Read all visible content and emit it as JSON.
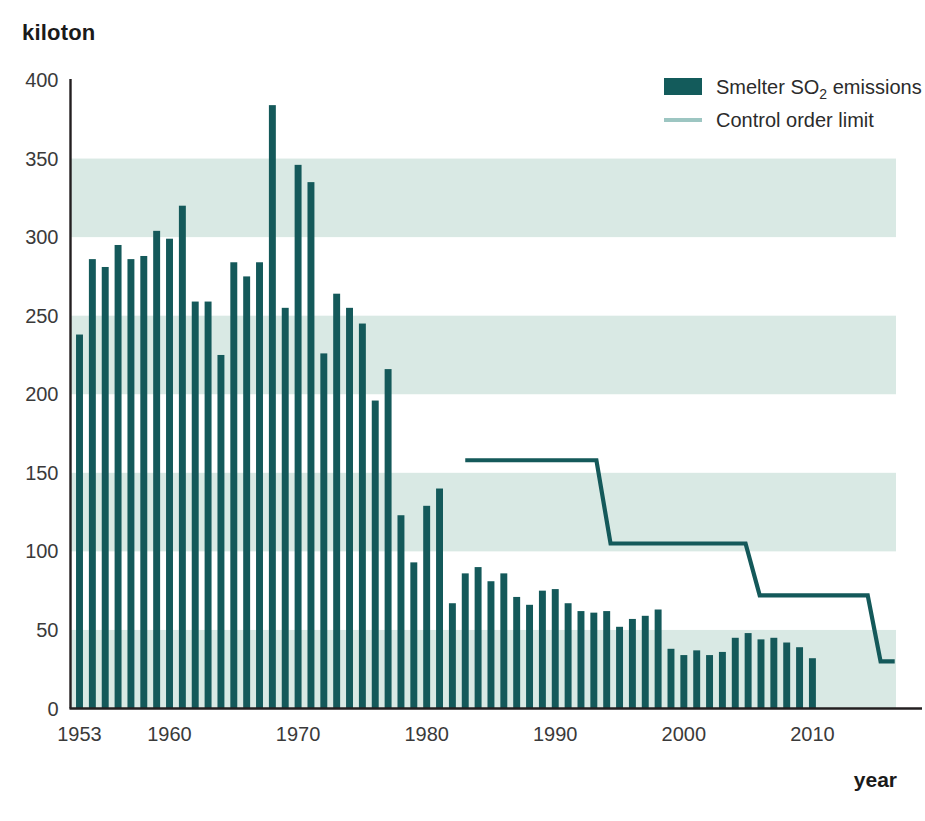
{
  "axis": {
    "unit_label": "kiloton",
    "x_axis_title": "year"
  },
  "legend": {
    "items": [
      {
        "label_prefix": "Smelter SO",
        "label_sub": "2",
        "label_suffix": " emissions",
        "label": "Smelter SO2 emissions",
        "type": "swatch",
        "color": "#135b5b"
      },
      {
        "label": "Control order limit",
        "type": "line",
        "color": "#9dc6c2"
      }
    ]
  },
  "colors": {
    "bar": "#14595a",
    "band": "#d9e9e4",
    "axis": "#231f20",
    "control_line": "#14595a",
    "background": "#ffffff"
  },
  "chart_data": {
    "type": "bar",
    "title": "",
    "subtitle": "",
    "xlabel": "year",
    "ylabel": "kiloton",
    "ylim": [
      0,
      400
    ],
    "xlim": [
      1952.3,
      2016.5
    ],
    "yticks": [
      0,
      50,
      100,
      150,
      200,
      250,
      300,
      350,
      400
    ],
    "xticks": [
      1953,
      1960,
      1970,
      1980,
      1990,
      2000,
      2010
    ],
    "grid": false,
    "bands": [
      [
        0,
        50
      ],
      [
        100,
        150
      ],
      [
        200,
        250
      ],
      [
        300,
        350
      ]
    ],
    "legend_position": "top-right",
    "categories": [
      1953,
      1954,
      1955,
      1956,
      1957,
      1958,
      1959,
      1960,
      1961,
      1962,
      1963,
      1964,
      1965,
      1966,
      1967,
      1968,
      1969,
      1970,
      1971,
      1972,
      1973,
      1974,
      1975,
      1976,
      1977,
      1978,
      1979,
      1980,
      1981,
      1982,
      1983,
      1984,
      1985,
      1986,
      1987,
      1988,
      1989,
      1990,
      1991,
      1992,
      1993,
      1994,
      1995,
      1996,
      1997,
      1998,
      1999,
      2000,
      2001,
      2002,
      2003,
      2004,
      2005,
      2006,
      2007,
      2008,
      2009,
      2010
    ],
    "series": [
      {
        "name": "Smelter SO2 emissions",
        "type": "bar",
        "color": "#14595a",
        "values": [
          238,
          286,
          281,
          295,
          286,
          288,
          304,
          299,
          320,
          259,
          259,
          225,
          284,
          275,
          284,
          384,
          255,
          346,
          335,
          226,
          264,
          255,
          245,
          196,
          216,
          123,
          93,
          129,
          140,
          67,
          86,
          90,
          81,
          86,
          71,
          66,
          75,
          76,
          67,
          62,
          61,
          62,
          52,
          57,
          59,
          63,
          38,
          34,
          37,
          34,
          36,
          45,
          48,
          44,
          45,
          42,
          39,
          32
        ]
      },
      {
        "name": "Control order limit",
        "type": "step-line",
        "color": "#14595a",
        "points": [
          {
            "x": 1983.0,
            "y": 158
          },
          {
            "x": 1993.2,
            "y": 158
          },
          {
            "x": 1994.3,
            "y": 105
          },
          {
            "x": 2004.8,
            "y": 105
          },
          {
            "x": 2005.9,
            "y": 72
          },
          {
            "x": 2014.3,
            "y": 72
          },
          {
            "x": 2015.3,
            "y": 30
          },
          {
            "x": 2016.4,
            "y": 30
          }
        ]
      }
    ]
  }
}
